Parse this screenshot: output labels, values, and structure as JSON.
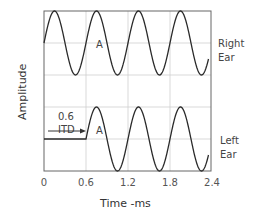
{
  "chart_data": {
    "type": "line",
    "title": "",
    "xlabel": "Time -ms",
    "ylabel": "Amplitude",
    "xlim": [
      0,
      2.4
    ],
    "xticks": [
      "0",
      "0.6",
      "1.2",
      "1.8",
      "2.4"
    ],
    "grid": true,
    "series": [
      {
        "name": "Right Ear",
        "label_lines": [
          "Right",
          "Ear"
        ],
        "waveform": "sine",
        "start_ms": 0,
        "end_ms": 2.35,
        "period_ms": 0.6,
        "peaks_ms": [
          0.15,
          0.75,
          1.35,
          1.95
        ],
        "peak_label": "A",
        "peak_label_at_ms": 0.75
      },
      {
        "name": "Left Ear",
        "label_lines": [
          "Left",
          "Ear"
        ],
        "waveform": "sine",
        "flat_until_ms": 0.6,
        "start_ms": 0.6,
        "end_ms": 2.35,
        "period_ms": 0.6,
        "peaks_ms": [
          0.75,
          1.35,
          1.95
        ],
        "peak_label": "A",
        "peak_label_at_ms": 0.75
      }
    ],
    "annotations": [
      {
        "text_lines": [
          "0.6",
          "ITD"
        ],
        "type": "arrow",
        "from_ms": 0.05,
        "to_ms": 0.6,
        "series": "Left Ear"
      }
    ]
  }
}
